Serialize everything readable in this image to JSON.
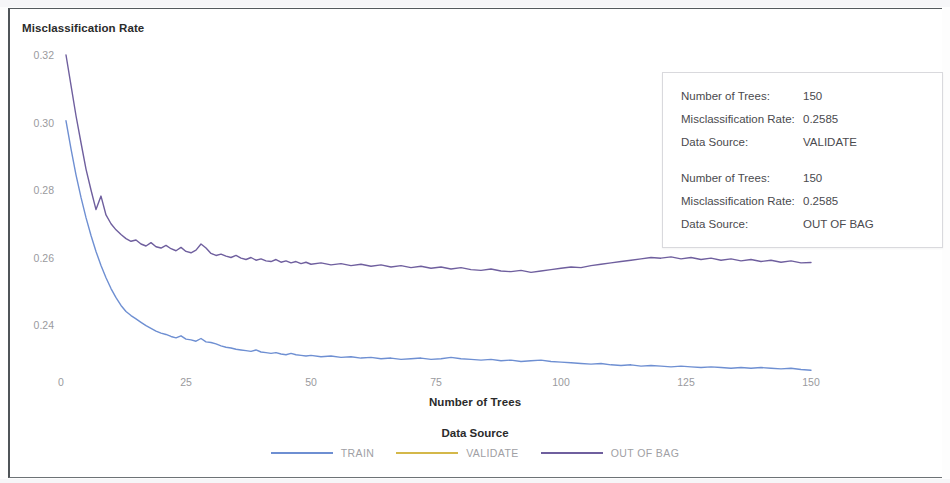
{
  "chart_data": {
    "type": "line",
    "title": "",
    "ylabel": "Misclassification Rate",
    "xlabel": "Number of Trees",
    "xlim": [
      0,
      150
    ],
    "ylim": [
      0.225,
      0.325
    ],
    "xticks": [
      "0",
      "25",
      "50",
      "75",
      "100",
      "125",
      "150"
    ],
    "xtick_values": [
      0,
      25,
      50,
      75,
      100,
      125,
      150
    ],
    "yticks": [
      "0.32",
      "0.30",
      "0.28",
      "0.26",
      "0.24"
    ],
    "ytick_values": [
      0.32,
      0.3,
      0.28,
      0.26,
      0.24
    ],
    "grid": false,
    "legend_position": "bottom",
    "legend_title": "Data Source",
    "series": [
      {
        "name": "TRAIN",
        "color": "#6e8fd2",
        "x": [
          1,
          2,
          3,
          4,
          5,
          6,
          7,
          8,
          9,
          10,
          11,
          12,
          13,
          14,
          15,
          16,
          17,
          18,
          19,
          20,
          21,
          22,
          23,
          24,
          25,
          26,
          27,
          28,
          29,
          30,
          31,
          32,
          33,
          34,
          35,
          36,
          37,
          38,
          39,
          40,
          41,
          42,
          43,
          44,
          45,
          46,
          47,
          48,
          49,
          50,
          52,
          54,
          56,
          58,
          60,
          62,
          64,
          66,
          68,
          70,
          72,
          74,
          76,
          78,
          80,
          82,
          84,
          86,
          88,
          90,
          92,
          94,
          96,
          98,
          100,
          102,
          104,
          106,
          108,
          110,
          112,
          114,
          116,
          118,
          120,
          122,
          124,
          126,
          128,
          130,
          132,
          134,
          136,
          138,
          140,
          142,
          144,
          146,
          148,
          150
        ],
        "values": [
          0.3005,
          0.2922,
          0.2845,
          0.2778,
          0.2718,
          0.2665,
          0.2618,
          0.2576,
          0.254,
          0.2508,
          0.2481,
          0.2458,
          0.244,
          0.2428,
          0.2418,
          0.2408,
          0.2398,
          0.239,
          0.2382,
          0.2376,
          0.2372,
          0.2366,
          0.2362,
          0.2368,
          0.2358,
          0.2356,
          0.2352,
          0.236,
          0.235,
          0.2348,
          0.2344,
          0.2338,
          0.2334,
          0.2332,
          0.2328,
          0.2326,
          0.2324,
          0.2322,
          0.2326,
          0.232,
          0.2318,
          0.2316,
          0.2318,
          0.2314,
          0.2312,
          0.2316,
          0.2312,
          0.231,
          0.2308,
          0.231,
          0.2306,
          0.2308,
          0.2304,
          0.2306,
          0.2302,
          0.2304,
          0.23,
          0.2302,
          0.2298,
          0.23,
          0.2302,
          0.2298,
          0.23,
          0.2304,
          0.23,
          0.2298,
          0.2296,
          0.2298,
          0.2294,
          0.2296,
          0.2292,
          0.2294,
          0.2296,
          0.2292,
          0.229,
          0.2288,
          0.2286,
          0.2284,
          0.2286,
          0.2282,
          0.228,
          0.2282,
          0.2278,
          0.228,
          0.2278,
          0.2276,
          0.2278,
          0.2276,
          0.2274,
          0.2276,
          0.2274,
          0.2272,
          0.2274,
          0.2272,
          0.2274,
          0.2272,
          0.227,
          0.2272,
          0.2268,
          0.2266
        ]
      },
      {
        "name": "VALIDATE",
        "color": "#d4b84a",
        "x": [],
        "values": []
      },
      {
        "name": "OUT OF BAG",
        "color": "#6f5f9e",
        "x": [
          1,
          2,
          3,
          4,
          5,
          6,
          7,
          8,
          9,
          10,
          11,
          12,
          13,
          14,
          15,
          16,
          17,
          18,
          19,
          20,
          21,
          22,
          23,
          24,
          25,
          26,
          27,
          28,
          29,
          30,
          31,
          32,
          33,
          34,
          35,
          36,
          37,
          38,
          39,
          40,
          41,
          42,
          43,
          44,
          45,
          46,
          47,
          48,
          49,
          50,
          52,
          54,
          56,
          58,
          60,
          62,
          64,
          66,
          68,
          70,
          72,
          74,
          76,
          78,
          80,
          82,
          84,
          86,
          88,
          90,
          92,
          94,
          96,
          98,
          100,
          102,
          104,
          106,
          108,
          110,
          112,
          114,
          116,
          118,
          120,
          122,
          124,
          126,
          128,
          130,
          132,
          134,
          136,
          138,
          140,
          142,
          144,
          146,
          148,
          150
        ],
        "values": [
          0.32,
          0.311,
          0.302,
          0.294,
          0.2862,
          0.28,
          0.2742,
          0.2782,
          0.2726,
          0.27,
          0.2682,
          0.2668,
          0.2656,
          0.2648,
          0.2652,
          0.264,
          0.2634,
          0.2644,
          0.2632,
          0.2628,
          0.2636,
          0.2626,
          0.262,
          0.263,
          0.2618,
          0.2614,
          0.2622,
          0.264,
          0.2628,
          0.2612,
          0.2606,
          0.261,
          0.2604,
          0.26,
          0.2606,
          0.2598,
          0.2594,
          0.26,
          0.2592,
          0.2596,
          0.259,
          0.2588,
          0.2594,
          0.2586,
          0.259,
          0.2584,
          0.2588,
          0.2582,
          0.2586,
          0.258,
          0.2584,
          0.2578,
          0.2582,
          0.2576,
          0.258,
          0.2574,
          0.2578,
          0.2572,
          0.2576,
          0.257,
          0.2574,
          0.2568,
          0.2572,
          0.2566,
          0.257,
          0.2564,
          0.2562,
          0.2566,
          0.256,
          0.2558,
          0.2562,
          0.2556,
          0.256,
          0.2564,
          0.2568,
          0.2572,
          0.257,
          0.2576,
          0.258,
          0.2584,
          0.2588,
          0.2592,
          0.2596,
          0.26,
          0.2598,
          0.2602,
          0.2596,
          0.26,
          0.2594,
          0.2598,
          0.2592,
          0.2596,
          0.259,
          0.2594,
          0.2588,
          0.2592,
          0.2586,
          0.259,
          0.2584,
          0.2585
        ]
      }
    ]
  },
  "axes": {
    "y_title": "Misclassification Rate",
    "x_title": "Number of Trees"
  },
  "legend": {
    "title": "Data Source",
    "items": [
      {
        "label": "TRAIN",
        "color": "#6e8fd2"
      },
      {
        "label": "VALIDATE",
        "color": "#d4b84a"
      },
      {
        "label": "OUT OF BAG",
        "color": "#6f5f9e"
      }
    ]
  },
  "tooltip": {
    "groups": [
      {
        "rows": [
          {
            "label": "Number of Trees:",
            "value": "150"
          },
          {
            "label": "Misclassification Rate:",
            "value": "0.2585"
          },
          {
            "label": "Data Source:",
            "value": "VALIDATE"
          }
        ]
      },
      {
        "rows": [
          {
            "label": "Number of Trees:",
            "value": "150"
          },
          {
            "label": "Misclassification Rate:",
            "value": "0.2585"
          },
          {
            "label": "Data Source:",
            "value": "OUT OF BAG"
          }
        ]
      }
    ]
  }
}
